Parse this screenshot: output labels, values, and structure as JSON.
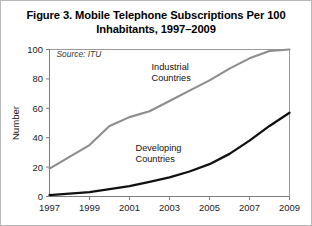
{
  "figure": {
    "title": "Figure 3. Mobile Telephone Subscriptions Per 100 Inhabitants, 1997–2009",
    "title_line1": "Figure 3. Mobile Telephone Subscriptions Per 100",
    "title_line2": "Inhabitants, 1997–2009",
    "source_note": "Source: ITU"
  },
  "chart_data": {
    "type": "line",
    "title": "Figure 3. Mobile Telephone Subscriptions Per 100 Inhabitants, 1997–2009",
    "xlabel": "",
    "ylabel": "Number",
    "xlim": [
      1997,
      2009
    ],
    "ylim": [
      0,
      100
    ],
    "ytick_values": [
      0,
      20,
      40,
      60,
      80,
      100
    ],
    "ytick_labels": [
      "0",
      "20",
      "40",
      "60",
      "80",
      "100"
    ],
    "xtick_values": [
      1997,
      1999,
      2001,
      2003,
      2005,
      2007,
      2009
    ],
    "xtick_labels": [
      "1997",
      "1999",
      "2001",
      "2003",
      "2005",
      "2007",
      "2009"
    ],
    "grid": false,
    "legend": "inline-labels",
    "x": [
      1997,
      1998,
      1999,
      2000,
      2001,
      2002,
      2003,
      2004,
      2005,
      2006,
      2007,
      2008,
      2009
    ],
    "series": [
      {
        "name": "Industrial Countries",
        "color": "#8d8d8d",
        "width": 2.1,
        "label_x": 2002.1,
        "label_y": 86,
        "values": [
          19,
          27,
          35,
          48,
          54,
          58,
          65,
          72,
          79,
          87,
          94,
          99,
          100
        ]
      },
      {
        "name": "Developing Countries",
        "color": "#111111",
        "width": 2.3,
        "label_x": 2001.3,
        "label_y": 31,
        "values": [
          1,
          2,
          3,
          5,
          7,
          10,
          13,
          17,
          22,
          29,
          38,
          48,
          57
        ]
      }
    ],
    "annotations": [
      {
        "text": "Source: ITU",
        "x": 1997.35,
        "y": 95
      }
    ]
  }
}
